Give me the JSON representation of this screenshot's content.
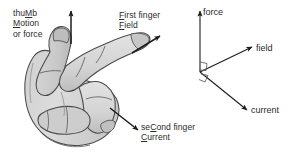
{
  "figure": {
    "background_color": "#ffffff",
    "ink_color": "#2b2b2b",
    "hand_fill_color": "#d9d9d9",
    "hand_shade_color": "#c2c2c2",
    "hand_outline_color": "#4a4a4a"
  },
  "hand_labels": {
    "thumb": {
      "line1_pre": "thu",
      "line1_key": "M",
      "line1_post": "b",
      "line2_key": "M",
      "line2_post": "otion",
      "line3": "or force"
    },
    "first_finger": {
      "line1_key": "F",
      "line1_post": "irst finger",
      "line2_key": "F",
      "line2_post": "ield"
    },
    "second_finger": {
      "line1_pre": "se",
      "line1_key": "C",
      "line1_post": "ond finger",
      "line2_key": "C",
      "line2_post": "urrent"
    }
  },
  "vector_diagram": {
    "force_label": "force",
    "field_label": "field",
    "current_label": "current",
    "right_angle_markers": 2
  }
}
